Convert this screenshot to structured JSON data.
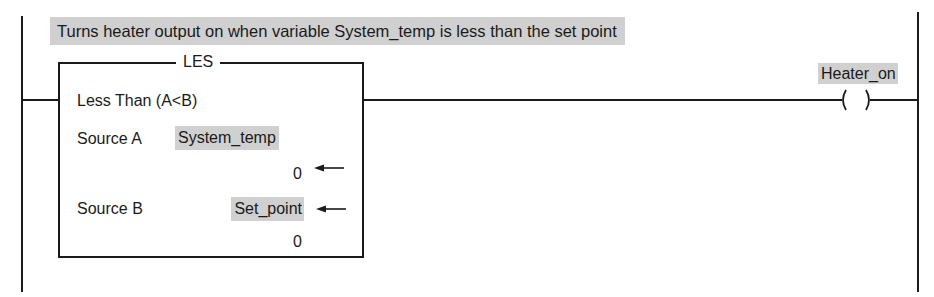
{
  "rung": {
    "comment": "Turns heater output on when variable System_temp is less than the set point",
    "instruction": {
      "mnemonic": "LES",
      "description": "Less Than (A<B)",
      "source_a": {
        "label": "Source A",
        "tag": "System_temp",
        "value": "0"
      },
      "source_b": {
        "label": "Source B",
        "tag": "Set_point",
        "value": "0"
      }
    },
    "output": {
      "tag": "Heater_on",
      "type": "output-energize-coil",
      "symbol": "(   )"
    }
  },
  "colors": {
    "line": "#1a1a1a",
    "highlight": "#d0d0d0",
    "background": "#ffffff"
  }
}
